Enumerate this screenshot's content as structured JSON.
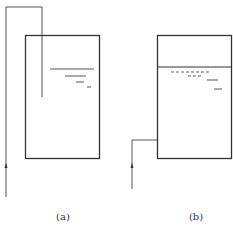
{
  "figure": {
    "panels": [
      {
        "id": "a",
        "label": "(a)",
        "description": "Tank with inlet pipe entering from top, discharging below liquid surface"
      },
      {
        "id": "b",
        "label": "(b)",
        "description": "Tank with inlet pipe entering from side near bottom, liquid surface near top"
      }
    ]
  },
  "colors": {
    "stroke": "#333333",
    "pipe": "#555555",
    "background": "#ffffff"
  }
}
